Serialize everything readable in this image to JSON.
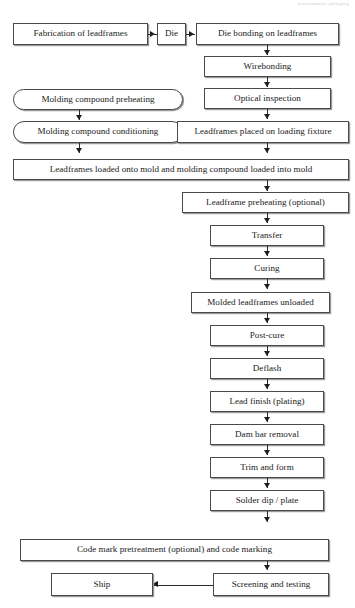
{
  "page": {
    "running_header": "semiconductor packaging"
  },
  "flowchart": {
    "title": "Semiconductor leadframe packaging process flow",
    "nodes": [
      {
        "id": "fabrication",
        "label": "Fabrication of leadframes",
        "shape": "rect"
      },
      {
        "id": "die",
        "label": "Die",
        "shape": "rect"
      },
      {
        "id": "die-bonding",
        "label": "Die bonding on leadframes",
        "shape": "rect"
      },
      {
        "id": "wirebonding",
        "label": "Wirebonding",
        "shape": "rect"
      },
      {
        "id": "optical-inspection",
        "label": "Optical inspection",
        "shape": "rect"
      },
      {
        "id": "preheating",
        "label": "Molding compound preheating",
        "shape": "rounded"
      },
      {
        "id": "conditioning",
        "label": "Molding compound conditioning",
        "shape": "rounded"
      },
      {
        "id": "loading-fixture",
        "label": "Leadframes placed on loading fixture",
        "shape": "rect"
      },
      {
        "id": "loaded-onto-mold",
        "label": "Leadframes loaded onto mold and molding compound loaded into mold",
        "shape": "rect"
      },
      {
        "id": "leadframe-preheat",
        "label": "Leadframe preheating (optional)",
        "shape": "rect"
      },
      {
        "id": "transfer",
        "label": "Transfer",
        "shape": "rect"
      },
      {
        "id": "curing",
        "label": "Curing",
        "shape": "rect"
      },
      {
        "id": "molded-unloaded",
        "label": "Molded leadframes unloaded",
        "shape": "rect"
      },
      {
        "id": "post-cure",
        "label": "Post-cure",
        "shape": "rect"
      },
      {
        "id": "deflash",
        "label": "Deflash",
        "shape": "rect"
      },
      {
        "id": "lead-finish",
        "label": "Lead finish (plating)",
        "shape": "rect"
      },
      {
        "id": "dam-bar-removal",
        "label": "Dam bar removal",
        "shape": "rect"
      },
      {
        "id": "trim-and-form",
        "label": "Trim and form",
        "shape": "rect"
      },
      {
        "id": "solder-dip",
        "label": "Solder dip / plate",
        "shape": "rect"
      },
      {
        "id": "code-marking",
        "label": "Code mark pretreatment (optional)  and code marking",
        "shape": "rect"
      },
      {
        "id": "screening",
        "label": "Screening and testing",
        "shape": "rect"
      },
      {
        "id": "ship",
        "label": "Ship",
        "shape": "rect"
      }
    ],
    "edges": [
      {
        "from": "fabrication",
        "to": "die",
        "direction": "right"
      },
      {
        "from": "die",
        "to": "die-bonding",
        "direction": "right"
      },
      {
        "from": "die-bonding",
        "to": "wirebonding",
        "direction": "down"
      },
      {
        "from": "wirebonding",
        "to": "optical-inspection",
        "direction": "down"
      },
      {
        "from": "optical-inspection",
        "to": "loading-fixture",
        "direction": "down"
      },
      {
        "from": "preheating",
        "to": "conditioning",
        "direction": "down"
      },
      {
        "from": "conditioning",
        "to": "loaded-onto-mold",
        "direction": "down"
      },
      {
        "from": "loading-fixture",
        "to": "loaded-onto-mold",
        "direction": "down"
      },
      {
        "from": "loaded-onto-mold",
        "to": "leadframe-preheat",
        "direction": "down"
      },
      {
        "from": "leadframe-preheat",
        "to": "transfer",
        "direction": "down"
      },
      {
        "from": "transfer",
        "to": "curing",
        "direction": "down"
      },
      {
        "from": "curing",
        "to": "molded-unloaded",
        "direction": "down"
      },
      {
        "from": "molded-unloaded",
        "to": "post-cure",
        "direction": "down"
      },
      {
        "from": "post-cure",
        "to": "deflash",
        "direction": "down"
      },
      {
        "from": "deflash",
        "to": "lead-finish",
        "direction": "down"
      },
      {
        "from": "lead-finish",
        "to": "dam-bar-removal",
        "direction": "down"
      },
      {
        "from": "dam-bar-removal",
        "to": "trim-and-form",
        "direction": "down"
      },
      {
        "from": "trim-and-form",
        "to": "solder-dip",
        "direction": "down"
      },
      {
        "from": "solder-dip",
        "to": "code-marking",
        "direction": "down"
      },
      {
        "from": "code-marking",
        "to": "screening",
        "direction": "down"
      },
      {
        "from": "screening",
        "to": "ship",
        "direction": "left"
      }
    ]
  }
}
